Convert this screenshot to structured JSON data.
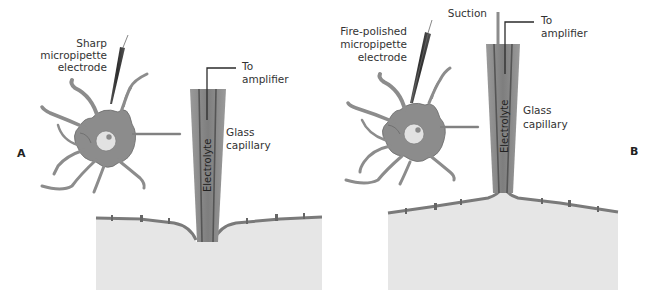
{
  "figure": {
    "colors": {
      "background": "#ffffff",
      "cell_body": "#8c8c8c",
      "cell_outline": "#6e6e6e",
      "nucleus": "#e2e2e2",
      "nucleolus": "#8a8a8a",
      "tissue": "#e6e6e6",
      "membrane": "#7d7d7d",
      "capillary_outer": "#8a8a8a",
      "capillary_inner": "#6b6b6b",
      "electrode_dark": "#3c3c3c",
      "text": "#333333"
    }
  },
  "panels": [
    {
      "id": "A",
      "panel_label": "A",
      "electrode_label_lines": [
        "Sharp",
        "micropipette",
        "electrode"
      ],
      "amplifier_label_lines": [
        "To",
        "amplifier"
      ],
      "capillary_label_lines": [
        "Glass",
        "capillary"
      ],
      "electrolyte_label": "Electrolyte",
      "membrane_shape": "indented"
    },
    {
      "id": "B",
      "panel_label": "B",
      "suction_label": "Suction",
      "electrode_label_lines": [
        "Fire-polished",
        "micropipette",
        "electrode"
      ],
      "amplifier_label_lines": [
        "To",
        "amplifier"
      ],
      "capillary_label_lines": [
        "Glass",
        "capillary"
      ],
      "electrolyte_label": "Electrolyte",
      "membrane_shape": "pulled-up"
    }
  ]
}
